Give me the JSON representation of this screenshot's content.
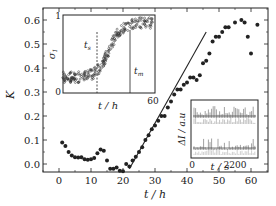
{
  "chart_data": [
    {
      "id": "main",
      "type": "scatter",
      "title": "",
      "xlabel": "t/h",
      "ylabel": "K",
      "xlim": [
        -5,
        65
      ],
      "ylim": [
        -0.05,
        0.64
      ],
      "xticks": [
        0,
        10,
        20,
        30,
        40,
        50,
        60
      ],
      "yticks": [
        0.0,
        0.1,
        0.2,
        0.3,
        0.4,
        0.5,
        0.6
      ],
      "ytick_labels": [
        "0.0",
        "0.1",
        "0.2",
        "0.3",
        "0.4",
        "0.5",
        "0.6"
      ],
      "grid": false,
      "series": [
        {
          "name": "K",
          "marker": "filled-circle",
          "x": [
            1,
            2,
            3,
            4,
            5,
            6,
            7,
            8,
            9,
            10,
            11,
            12,
            13,
            14,
            15,
            16,
            17,
            18,
            19,
            20,
            21,
            22,
            23,
            24,
            25,
            26,
            27,
            28,
            29,
            30,
            31,
            32,
            33,
            34,
            35,
            36,
            37,
            38,
            39,
            40,
            41,
            42,
            43,
            44,
            45,
            46,
            47,
            48,
            49,
            50,
            51,
            52,
            53,
            55,
            57,
            58,
            59,
            60,
            62
          ],
          "y": [
            0.09,
            0.075,
            0.05,
            0.035,
            0.028,
            0.027,
            0.028,
            0.02,
            0.018,
            0.02,
            0.025,
            0.045,
            0.06,
            0.055,
            0.015,
            -0.02,
            -0.02,
            -0.015,
            -0.028,
            -0.03,
            0.0,
            -0.01,
            0.015,
            0.03,
            0.05,
            0.07,
            0.1,
            0.12,
            0.145,
            0.16,
            0.18,
            0.2,
            0.2,
            0.235,
            0.26,
            0.29,
            0.31,
            0.31,
            0.33,
            0.34,
            0.36,
            0.36,
            0.35,
            0.37,
            0.42,
            0.43,
            0.46,
            0.51,
            0.53,
            0.53,
            0.55,
            0.57,
            0.57,
            0.59,
            0.6,
            0.59,
            0.53,
            0.46,
            0.58
          ]
        }
      ],
      "fit_line": {
        "name": "linear fit",
        "x": [
          22,
          46
        ],
        "y": [
          -0.02,
          0.55
        ]
      }
    },
    {
      "id": "inset_sigma",
      "type": "scatter",
      "xlabel": "t/h",
      "ylabel": "σ1",
      "xlim": [
        0,
        60
      ],
      "ylim": [
        0,
        1
      ],
      "xtick_labels": [
        "60"
      ],
      "ytick_labels": [
        "0",
        "1"
      ],
      "annotations": [
        {
          "text": "t_s",
          "x": 22,
          "style": "dashed-vertical-line"
        },
        {
          "text": "t_m",
          "x": 43,
          "style": "solid-vertical-line"
        }
      ],
      "description": "Dense open-circle scatter: flat ~0.2 until t_s, sigmoidal rise to ~0.9 plateau near t_m"
    },
    {
      "id": "inset_intensity",
      "type": "line",
      "xlabel": "t/s",
      "ylabel": "ΔI/a.u",
      "xtick_labels": [
        "0",
        "2200"
      ],
      "description": "Two stacked spike trains (intensity fluctuations vs time)"
    }
  ],
  "labels": {
    "main_xlabel": "t / h",
    "main_ylabel": "K",
    "inset1_xlabel": "t / h",
    "inset1_ylabel": "σ",
    "inset1_ylabel_sub": "1",
    "inset1_tick_0": "0",
    "inset1_tick_1": "1",
    "inset1_tick_60": "60",
    "inset1_ts": "t",
    "inset1_ts_sub": "s",
    "inset1_tm": "t",
    "inset1_tm_sub": "m",
    "inset2_xlabel": "t / s",
    "inset2_ylabel": "ΔI / a.u",
    "inset2_tick_0": "0",
    "inset2_tick_2200": "2200"
  },
  "colors": {
    "ink": "#222222",
    "background": "#ffffff"
  }
}
